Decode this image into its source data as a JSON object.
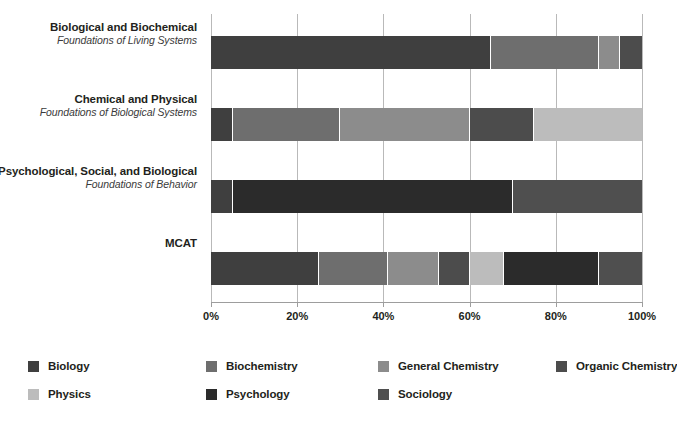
{
  "chart_data": {
    "type": "bar",
    "orientation": "horizontal",
    "stacked": true,
    "title": "",
    "subtitle": "",
    "xlabel": "",
    "ylabel": "",
    "xlim": [
      0,
      100
    ],
    "grid": true,
    "legend_position": "bottom",
    "x_ticks": [
      "0%",
      "20%",
      "40%",
      "60%",
      "80%",
      "100%"
    ],
    "x_tick_values": [
      0,
      20,
      40,
      60,
      80,
      100
    ],
    "categories": [
      {
        "line1": "Biological and Biochemical",
        "line2": "Foundations of Living Systems"
      },
      {
        "line1": "Chemical and Physical",
        "line2": "Foundations of Biological Systems"
      },
      {
        "line1": "Psychological, Social, and Biological",
        "line2": "Foundations of Behavior"
      },
      {
        "line1": "MCAT",
        "line2": ""
      }
    ],
    "series": [
      {
        "name": "Biology",
        "color": "#3f3f3f",
        "values": [
          65,
          5,
          5,
          25
        ]
      },
      {
        "name": "Biochemistry",
        "color": "#6e6e6e",
        "values": [
          25,
          25,
          0,
          16
        ]
      },
      {
        "name": "General Chemistry",
        "color": "#8c8c8c",
        "values": [
          5,
          30,
          0,
          12
        ]
      },
      {
        "name": "Organic Chemistry",
        "color": "#4c4c4c",
        "values": [
          5,
          15,
          0,
          7
        ]
      },
      {
        "name": "Physics",
        "color": "#bcbcbc",
        "values": [
          0,
          25,
          0,
          8
        ]
      },
      {
        "name": "Psychology",
        "color": "#2b2b2b",
        "values": [
          0,
          0,
          65,
          22
        ]
      },
      {
        "name": "Sociology",
        "color": "#4f4f4f",
        "values": [
          0,
          0,
          30,
          10
        ]
      }
    ],
    "stacks": [
      [
        {
          "series": "Biology",
          "value": 65,
          "color": "#3f3f3f"
        },
        {
          "series": "Biochemistry",
          "value": 25,
          "color": "#6e6e6e"
        },
        {
          "series": "General Chemistry",
          "value": 5,
          "color": "#8c8c8c"
        },
        {
          "series": "Organic Chemistry",
          "value": 5,
          "color": "#4c4c4c"
        }
      ],
      [
        {
          "series": "Biology",
          "value": 5,
          "color": "#3f3f3f"
        },
        {
          "series": "Biochemistry",
          "value": 25,
          "color": "#6e6e6e"
        },
        {
          "series": "General Chemistry",
          "value": 30,
          "color": "#8c8c8c"
        },
        {
          "series": "Organic Chemistry",
          "value": 15,
          "color": "#4c4c4c"
        },
        {
          "series": "Physics",
          "value": 25,
          "color": "#bcbcbc"
        }
      ],
      [
        {
          "series": "Biology",
          "value": 5,
          "color": "#3f3f3f"
        },
        {
          "series": "Psychology",
          "value": 65,
          "color": "#2b2b2b"
        },
        {
          "series": "Sociology",
          "value": 30,
          "color": "#4f4f4f"
        }
      ],
      [
        {
          "series": "Biology",
          "value": 25,
          "color": "#3f3f3f"
        },
        {
          "series": "Biochemistry",
          "value": 16,
          "color": "#6e6e6e"
        },
        {
          "series": "General Chemistry",
          "value": 12,
          "color": "#8c8c8c"
        },
        {
          "series": "Organic Chemistry",
          "value": 7,
          "color": "#4c4c4c"
        },
        {
          "series": "Physics",
          "value": 8,
          "color": "#bcbcbc"
        },
        {
          "series": "Psychology",
          "value": 22,
          "color": "#2b2b2b"
        },
        {
          "series": "Sociology",
          "value": 10,
          "color": "#4f4f4f"
        }
      ]
    ],
    "legend": [
      {
        "label": "Biology",
        "color": "#3f3f3f"
      },
      {
        "label": "Biochemistry",
        "color": "#6e6e6e"
      },
      {
        "label": "General Chemistry",
        "color": "#8c8c8c"
      },
      {
        "label": "Organic Chemistry",
        "color": "#4c4c4c"
      },
      {
        "label": "Physics",
        "color": "#bcbcbc"
      },
      {
        "label": "Psychology",
        "color": "#2b2b2b"
      },
      {
        "label": "Sociology",
        "color": "#4f4f4f"
      }
    ]
  }
}
